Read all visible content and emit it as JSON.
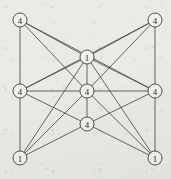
{
  "figure": {
    "background_color": "#eceae6",
    "edge_color": "#4a4a4a",
    "node_fill_color": "#f3f1ed",
    "node_stroke_color": "#3d3d3d",
    "label_color": "#2b2b2b",
    "width": 171,
    "height": 179
  },
  "chart_data": {
    "type": "diagram",
    "title": "",
    "xlabel": "",
    "ylabel": "",
    "legend": [],
    "grid": false,
    "node_count": 9,
    "edge_count": 20,
    "nodes": [
      {
        "id": "top-left",
        "label": "4",
        "x": 20,
        "y": 20,
        "r": 7
      },
      {
        "id": "top-right",
        "label": "4",
        "x": 155,
        "y": 20,
        "r": 7
      },
      {
        "id": "top-middle",
        "label": "1",
        "x": 87,
        "y": 57,
        "r": 7
      },
      {
        "id": "left-middle",
        "label": "4",
        "x": 20,
        "y": 91,
        "r": 7
      },
      {
        "id": "center",
        "label": "4",
        "x": 87,
        "y": 91,
        "r": 7
      },
      {
        "id": "right-middle",
        "label": "4",
        "x": 155,
        "y": 91,
        "r": 7
      },
      {
        "id": "bottom-middle",
        "label": "4",
        "x": 87,
        "y": 124,
        "r": 7
      },
      {
        "id": "bottom-left",
        "label": "1",
        "x": 20,
        "y": 158,
        "r": 7
      },
      {
        "id": "bottom-right",
        "label": "1",
        "x": 155,
        "y": 158,
        "r": 7
      }
    ],
    "edges": [
      {
        "from": "top-left",
        "to": "left-middle"
      },
      {
        "from": "top-left",
        "to": "top-middle"
      },
      {
        "from": "top-left",
        "to": "center"
      },
      {
        "from": "top-left",
        "to": "right-middle"
      },
      {
        "from": "top-right",
        "to": "right-middle"
      },
      {
        "from": "top-right",
        "to": "top-middle"
      },
      {
        "from": "top-right",
        "to": "center"
      },
      {
        "from": "top-right",
        "to": "left-middle"
      },
      {
        "from": "top-middle",
        "to": "center"
      },
      {
        "from": "top-middle",
        "to": "left-middle"
      },
      {
        "from": "top-middle",
        "to": "right-middle"
      },
      {
        "from": "left-middle",
        "to": "center"
      },
      {
        "from": "left-middle",
        "to": "bottom-left"
      },
      {
        "from": "left-middle",
        "to": "bottom-middle"
      },
      {
        "from": "center",
        "to": "right-middle"
      },
      {
        "from": "center",
        "to": "bottom-middle"
      },
      {
        "from": "center",
        "to": "bottom-left"
      },
      {
        "from": "center",
        "to": "bottom-right"
      },
      {
        "from": "right-middle",
        "to": "bottom-middle"
      },
      {
        "from": "right-middle",
        "to": "bottom-right"
      },
      {
        "from": "bottom-middle",
        "to": "bottom-left"
      },
      {
        "from": "bottom-middle",
        "to": "bottom-right"
      },
      {
        "from": "bottom-left",
        "to": "top-middle"
      },
      {
        "from": "bottom-right",
        "to": "top-middle"
      }
    ]
  }
}
